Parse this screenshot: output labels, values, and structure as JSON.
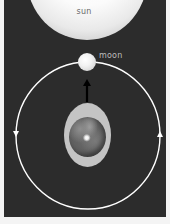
{
  "diagram": {
    "title": "",
    "labels": {
      "sun": "sun",
      "moon": "moon"
    },
    "elements": {
      "sun": {
        "shape": "circle",
        "fill": "#ffffff",
        "position": "top-center",
        "partially_cropped": true
      },
      "moon": {
        "shape": "circle",
        "fill": "#eeeeee",
        "position": "top of orbit, between earth and sun"
      },
      "earth": {
        "shape": "globe inside ellipse",
        "fill": "#6a6a6a",
        "ellipse_fill": "#c4c4c4",
        "position": "center of orbit"
      },
      "arrow_earth_to_moon": {
        "direction": "up",
        "color": "#000000",
        "from": "earth",
        "to": "moon"
      },
      "orbit": {
        "shape": "circle",
        "color": "#ffffff",
        "direction": "counter-clockwise",
        "arrows": [
          {
            "side": "left",
            "points": "down"
          },
          {
            "side": "right",
            "points": "up"
          }
        ]
      }
    },
    "colors": {
      "background": "#2c2c2c",
      "margin": "#f4f4f4",
      "orbit": "#ffffff",
      "sun_label": "#6a6a6a",
      "moon_label": "#bdbdbd"
    }
  }
}
